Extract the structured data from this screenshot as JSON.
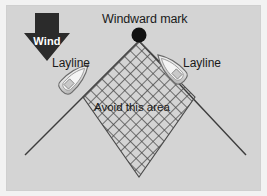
{
  "diagram": {
    "title": "Windward mark",
    "avoid_label": "Avoid this area",
    "wind_label": "Wind",
    "layline_left_label": "Layline",
    "layline_right_label": "Layline",
    "colors": {
      "panel_background": "#d4d4d4",
      "page_background": "#ffffff",
      "wind_arrow": "#2b2b2b",
      "mark_dot": "#111111",
      "layline": "#3c3c3c",
      "hatch": "#4a4a4a",
      "boat_hull": "#e8e8e8",
      "boat_outline": "#6a6a6a",
      "text": "#1a1a1a",
      "wind_text": "#ffffff"
    },
    "geometry": {
      "mark_point": [
        133,
        30
      ],
      "diamond_top": [
        133,
        36
      ],
      "diamond_left": [
        77,
        92
      ],
      "diamond_right": [
        189,
        92
      ],
      "diamond_bottom": [
        133,
        172
      ],
      "layline_left_end": [
        19,
        150
      ],
      "layline_right_end": [
        240,
        150
      ],
      "hatch_spacing_px": 8
    },
    "boats": [
      {
        "name": "boat-left",
        "x": 68,
        "y": 68,
        "heading_deg": 45
      },
      {
        "name": "boat-right",
        "x": 163,
        "y": 58,
        "heading_deg": -45
      }
    ]
  }
}
